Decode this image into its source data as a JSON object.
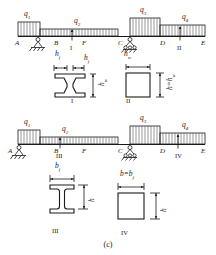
{
  "figure": {
    "caption": "(c)",
    "type": "structural-beam-loading-and-cross-sections"
  },
  "beam_top": {
    "name": "upper-continuous-beam",
    "loads": [
      {
        "id": "q1",
        "label": "q",
        "sub": "1",
        "span": "A-B",
        "relative_intensity": "tall"
      },
      {
        "id": "q2",
        "label": "q",
        "sub": "2",
        "span": "B-C",
        "relative_intensity": "short"
      },
      {
        "id": "q3",
        "label": "q",
        "sub": "3",
        "span": "C-D",
        "relative_intensity": "tall"
      },
      {
        "id": "q4",
        "label": "q",
        "sub": "4",
        "span": "D-E",
        "relative_intensity": "medium"
      }
    ],
    "points": [
      "A",
      "B",
      "F",
      "C",
      "D",
      "E"
    ],
    "supports": [
      {
        "at": "B",
        "kind": "pin-hatched"
      },
      {
        "at": "C",
        "kind": "roller-hatched"
      }
    ],
    "section_markers": [
      {
        "label": "I",
        "near": "F"
      },
      {
        "label": "II",
        "near": "D-E"
      }
    ]
  },
  "beam_bottom": {
    "name": "lower-continuous-beam",
    "loads": [
      {
        "id": "q1",
        "label": "q",
        "sub": "1",
        "span": "A-B",
        "relative_intensity": "tall"
      },
      {
        "id": "q2",
        "label": "q",
        "sub": "2",
        "span": "B-C",
        "relative_intensity": "short"
      },
      {
        "id": "q3",
        "label": "q",
        "sub": "3",
        "span": "C-D",
        "relative_intensity": "tall"
      },
      {
        "id": "q4",
        "label": "q",
        "sub": "4",
        "span": "D-E",
        "relative_intensity": "medium"
      }
    ],
    "points": [
      "A",
      "B",
      "F",
      "C",
      "D",
      "E"
    ],
    "supports": [
      {
        "at": "A",
        "kind": "pin-hatched"
      },
      {
        "at": "C",
        "kind": "roller-hatched"
      }
    ],
    "section_markers": [
      {
        "label": "III",
        "near": "B-F"
      },
      {
        "label": "IV",
        "near": "D-E"
      }
    ]
  },
  "sections": [
    {
      "id": "I",
      "label": "I",
      "shape": "tapered-web-i-section",
      "dims": [
        {
          "name": "hf_left",
          "label": "h",
          "sub": "f",
          "orientation": "horizontal"
        },
        {
          "name": "hf_right",
          "label": "h",
          "sub": "f",
          "orientation": "horizontal"
        },
        {
          "name": "h_web",
          "label": "h",
          "sub": "w",
          "orientation": "vertical"
        }
      ]
    },
    {
      "id": "II",
      "label": "II",
      "shape": "square-box",
      "dims": [
        {
          "name": "hw_top",
          "label": "h",
          "sub": "w",
          "orientation": "horizontal"
        },
        {
          "name": "h_eq_hw",
          "label": "h=h",
          "sub": "w",
          "orientation": "vertical"
        }
      ]
    },
    {
      "id": "III",
      "label": "III",
      "shape": "i-beam",
      "dims": [
        {
          "name": "bf",
          "label": "b",
          "sub": "f",
          "orientation": "horizontal"
        },
        {
          "name": "h",
          "label": "h",
          "sub": "",
          "orientation": "vertical"
        }
      ]
    },
    {
      "id": "IV",
      "label": "IV",
      "shape": "square",
      "dims": [
        {
          "name": "b_eq_bf",
          "label": "b=b",
          "sub": "f",
          "orientation": "horizontal"
        },
        {
          "name": "h",
          "label": "h",
          "sub": "",
          "orientation": "vertical"
        }
      ]
    }
  ]
}
